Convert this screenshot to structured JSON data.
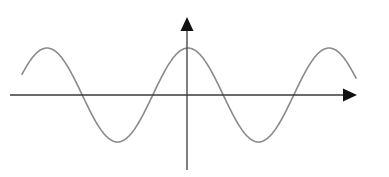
{
  "diagram": {
    "type": "cosine-wave-graph",
    "colors": {
      "axis": "#3a3a3a",
      "arrowhead": "#111111",
      "curve": "#8a8a8a",
      "background": "#ffffff"
    },
    "axes": {
      "x_axis": {
        "y": 95,
        "x_start": 10,
        "x_end": 357,
        "arrow": true
      },
      "y_axis": {
        "x": 187,
        "y_start": 170,
        "y_end": 17,
        "arrow": true
      }
    },
    "curve": {
      "function": "cos",
      "center_y": 95,
      "amplitude_px": 47,
      "period_px": 141,
      "phase_peak_x": 188,
      "x_start": 22,
      "x_end": 356
    }
  }
}
